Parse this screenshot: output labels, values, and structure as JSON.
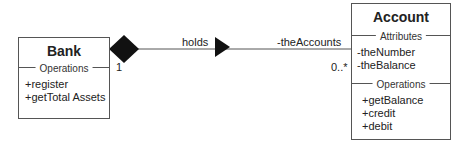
{
  "classes": {
    "bank": {
      "name": "Bank",
      "operations_label": "Operations",
      "operations": [
        "+register",
        "+getTotal Assets"
      ]
    },
    "account": {
      "name": "Account",
      "attributes_label": "Attributes",
      "attributes": [
        "-theNumber",
        "-theBalance"
      ],
      "operations_label": "Operations",
      "operations": [
        "+getBalance",
        "+credit",
        "+debit"
      ]
    }
  },
  "association": {
    "type": "composition",
    "name": "holds",
    "source_multiplicity": "1",
    "target_role": "-theAccounts",
    "target_multiplicity": "0..*"
  }
}
